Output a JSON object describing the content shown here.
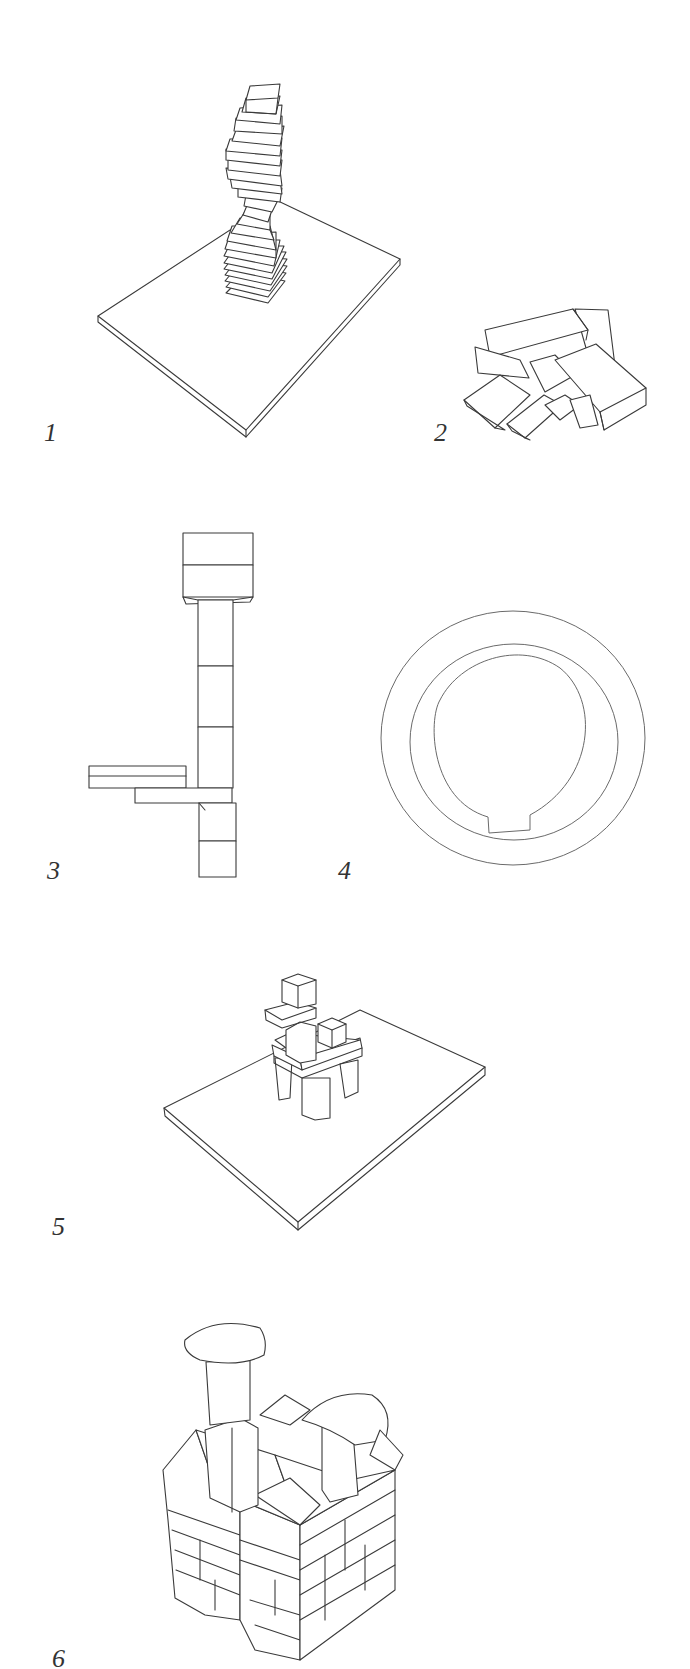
{
  "plate": {
    "background": "#ffffff",
    "line_color": "#3a3a3a",
    "figures": [
      {
        "id": 1,
        "label": "1",
        "subject": "spiral tower of stacked rectangular blocks on a square base board"
      },
      {
        "id": 2,
        "label": "2",
        "subject": "jumbled pile of rectangular blocks"
      },
      {
        "id": 3,
        "label": "3",
        "subject": "vertical column of blocks with cantilevered horizontal slabs"
      },
      {
        "id": 4,
        "label": "4",
        "subject": "concentric rings (plan view) with notch at bottom of inner ring"
      },
      {
        "id": 5,
        "label": "5",
        "subject": "small block structure with pillars on a base board"
      },
      {
        "id": 6,
        "label": "6",
        "subject": "castle-like block building with arched chimney pieces"
      }
    ]
  }
}
